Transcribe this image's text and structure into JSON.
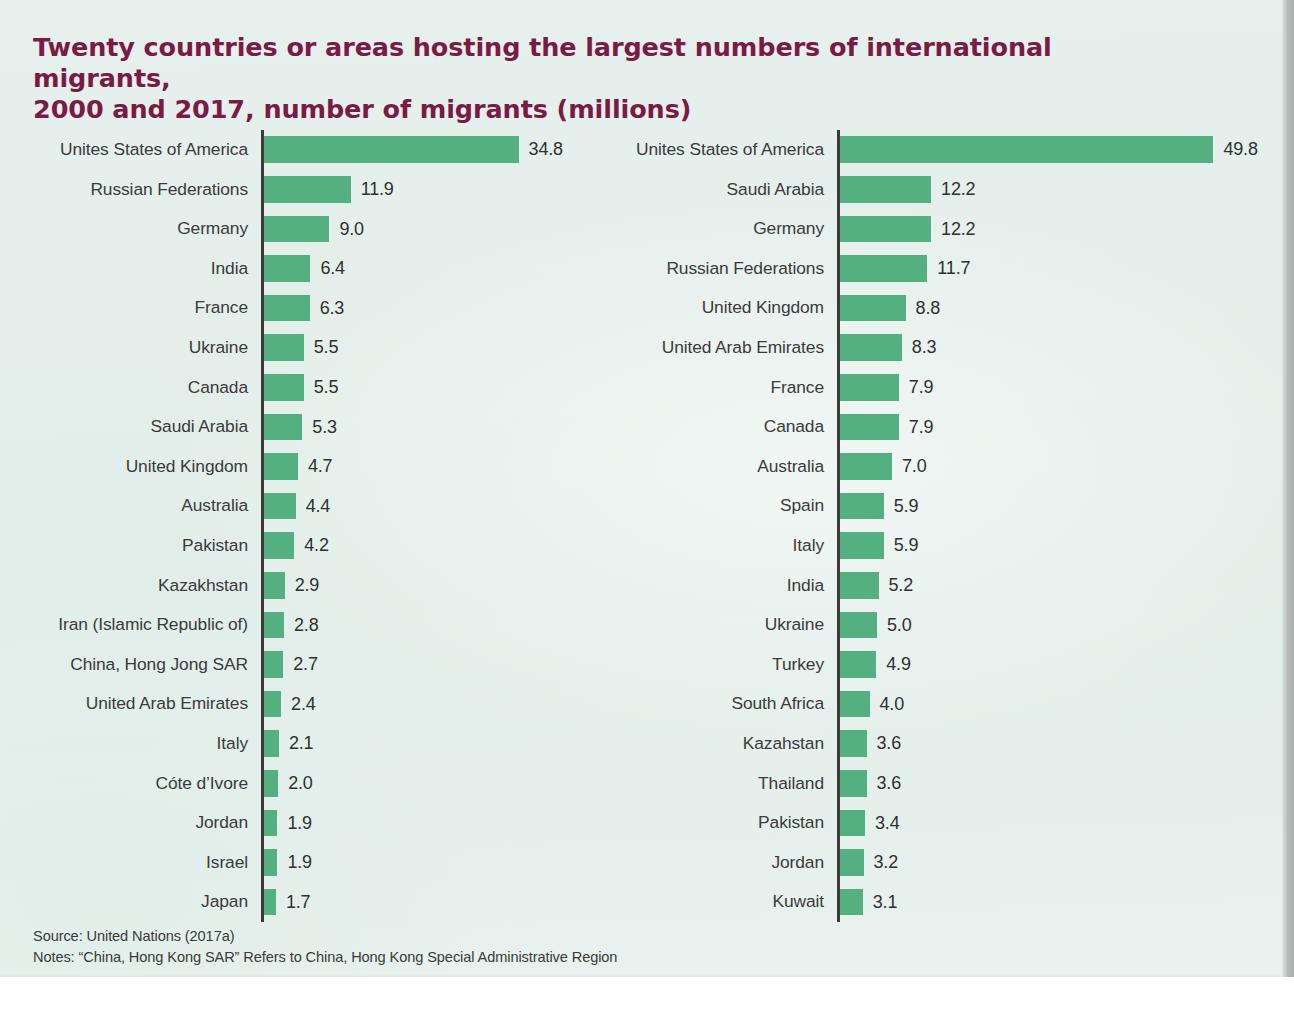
{
  "title": {
    "line1": "Twenty countries or areas hosting the largest numbers of international migrants,",
    "line2": "2000 and 2017, number of migrants (millions)"
  },
  "footnotes": {
    "source": "Source: United Nations (2017a)",
    "notes": "Notes: “China, Hong Kong SAR” Refers to China, Hong Kong Special Administrative Region"
  },
  "colors": {
    "bar": "#54b080",
    "title": "#7a1b45",
    "axis": "#3b3b3b",
    "label": "#3b3b3b",
    "background": "#e3efe9"
  },
  "chart_data": [
    {
      "type": "bar",
      "title": "2000",
      "orientation": "horizontal",
      "xlabel": "number of migrants (millions)",
      "ylabel": "",
      "xlim": [
        0,
        36
      ],
      "grid": false,
      "legend": "none",
      "categories": [
        "Unites States of America",
        "Russian Federations",
        "Germany",
        "India",
        "France",
        "Ukraine",
        "Canada",
        "Saudi Arabia",
        "United Kingdom",
        "Australia",
        "Pakistan",
        "Kazakhstan",
        "Iran (Islamic Republic of)",
        "China, Hong Jong SAR",
        "United Arab Emirates",
        "Italy",
        "Cóte d’Ivore",
        "Jordan",
        "Israel",
        "Japan"
      ],
      "values": [
        34.8,
        11.9,
        9.0,
        6.4,
        6.3,
        5.5,
        5.5,
        5.3,
        4.7,
        4.4,
        4.2,
        2.9,
        2.8,
        2.7,
        2.4,
        2.1,
        2.0,
        1.9,
        1.9,
        1.7
      ],
      "value_labels": [
        "34.8",
        "11.9",
        "9.0",
        "6.4",
        "6.3",
        "5.5",
        "5.5",
        "5.3",
        "4.7",
        "4.4",
        "4.2",
        "2.9",
        "2.8",
        "2.7",
        "2.4",
        "2.1",
        "2.0",
        "1.9",
        "1.9",
        "1.7"
      ]
    },
    {
      "type": "bar",
      "title": "2017",
      "orientation": "horizontal",
      "xlabel": "number of migrants (millions)",
      "ylabel": "",
      "xlim": [
        0,
        52
      ],
      "grid": false,
      "legend": "none",
      "categories": [
        "Unites States of America",
        "Saudi Arabia",
        "Germany",
        "Russian Federations",
        "United Kingdom",
        "United Arab Emirates",
        "France",
        "Canada",
        "Australia",
        "Spain",
        "Italy",
        "India",
        "Ukraine",
        "Turkey",
        "South Africa",
        "Kazahstan",
        "Thailand",
        "Pakistan",
        "Jordan",
        "Kuwait"
      ],
      "values": [
        49.8,
        12.2,
        12.2,
        11.7,
        8.8,
        8.3,
        7.9,
        7.9,
        7.0,
        5.9,
        5.9,
        5.2,
        5.0,
        4.9,
        4.0,
        3.6,
        3.6,
        3.4,
        3.2,
        3.1
      ],
      "value_labels": [
        "49.8",
        "12.2",
        "12.2",
        "11.7",
        "8.8",
        "8.3",
        "7.9",
        "7.9",
        "7.0",
        "5.9",
        "5.9",
        "5.2",
        "5.0",
        "4.9",
        "4.0",
        "3.6",
        "3.6",
        "3.4",
        "3.2",
        "3.1"
      ]
    }
  ]
}
